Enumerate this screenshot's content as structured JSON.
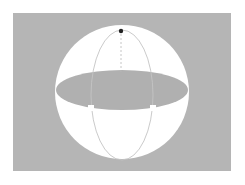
{
  "figure": {
    "type": "sphere-with-equatorial-plane",
    "colors": {
      "page_background": "#ffffff",
      "panel_background": "#b5b5b5",
      "sphere_fill": "#ffffff",
      "equatorial_disk": "#b0b0b0",
      "meridian_line": "#c4c4c4",
      "axis_line": "#b8b8b8",
      "pole_point": "#222222"
    },
    "panel": {
      "x": 13,
      "y": 13,
      "width": 218,
      "height": 158
    },
    "sphere": {
      "cx": 122,
      "cy": 92,
      "r": 67
    },
    "equator": {
      "cx": 122,
      "cy": 90,
      "rx": 66,
      "ry": 20
    },
    "meridian": {
      "cx": 122,
      "cy": 95,
      "rx": 31,
      "ry": 65
    },
    "pole": {
      "x": 121,
      "y": 31,
      "r": 2.2
    },
    "right_angle_markers": [
      {
        "x": 88,
        "y": 105
      },
      {
        "x": 150,
        "y": 105
      }
    ]
  }
}
